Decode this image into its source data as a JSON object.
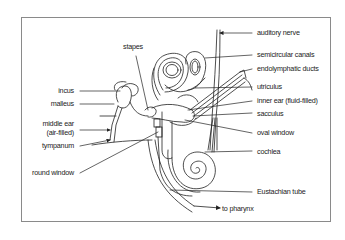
{
  "diagram": {
    "labels_left": [
      {
        "id": "incus",
        "text": "incus"
      },
      {
        "id": "malleus",
        "text": "malleus"
      },
      {
        "id": "middle_ear_1",
        "text": "middle ear"
      },
      {
        "id": "middle_ear_2",
        "text": "(air-filled)"
      },
      {
        "id": "tympanum",
        "text": "tympanum"
      },
      {
        "id": "round_window",
        "text": "round window"
      }
    ],
    "labels_top": [
      {
        "id": "stapes",
        "text": "stapes"
      }
    ],
    "labels_right": [
      {
        "id": "auditory_nerve",
        "text": "auditory nerve"
      },
      {
        "id": "semicircular_canals",
        "text": "semicircular canals"
      },
      {
        "id": "endolymphatic_ducts",
        "text": "endolymphatic ducts"
      },
      {
        "id": "utriculus",
        "text": "utriculus"
      },
      {
        "id": "inner_ear",
        "text": "inner ear (fluid-filled)"
      },
      {
        "id": "sacculus",
        "text": "sacculus"
      },
      {
        "id": "oval_window",
        "text": "oval window"
      },
      {
        "id": "cochlea",
        "text": "cochlea"
      },
      {
        "id": "eustachian_tube",
        "text": "Eustachian tube"
      }
    ],
    "labels_bottom": [
      {
        "id": "to_pharynx",
        "text": "to pharynx"
      }
    ],
    "colors": {
      "line": "#222222",
      "frame": "#8a8a8a",
      "background": "#ffffff"
    }
  }
}
